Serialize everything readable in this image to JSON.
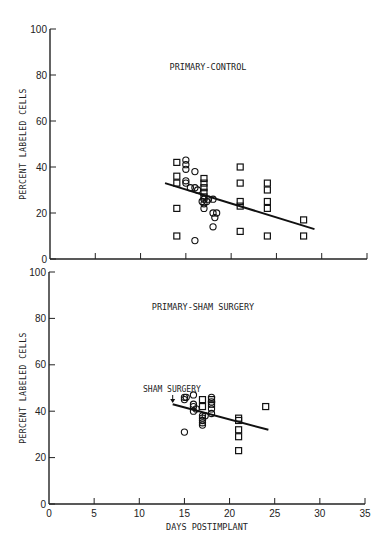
{
  "chart_data": [
    {
      "type": "scatter",
      "title": "PRIMARY-CONTROL",
      "xlabel": "",
      "ylabel": "Percent Labeled Cells",
      "xlim": [
        0,
        35
      ],
      "ylim": [
        0,
        100
      ],
      "x_ticks": [
        0,
        5,
        10,
        15,
        20,
        25,
        30,
        35
      ],
      "y_ticks": [
        0,
        20,
        40,
        60,
        80,
        100
      ],
      "x_tick_labels_shown": false,
      "grid": false,
      "series": [
        {
          "name": "squares",
          "marker": "square",
          "points": [
            [
              14,
              42
            ],
            [
              14,
              36
            ],
            [
              14,
              33
            ],
            [
              14,
              22
            ],
            [
              14,
              10
            ],
            [
              17,
              35
            ],
            [
              17,
              33
            ],
            [
              17,
              31
            ],
            [
              17,
              29
            ],
            [
              17,
              27
            ],
            [
              21,
              40
            ],
            [
              21,
              33
            ],
            [
              21,
              25
            ],
            [
              21,
              23
            ],
            [
              21,
              12
            ],
            [
              24,
              33
            ],
            [
              24,
              30
            ],
            [
              24,
              25
            ],
            [
              24,
              22
            ],
            [
              24,
              10
            ],
            [
              28,
              17
            ],
            [
              28,
              10
            ]
          ]
        },
        {
          "name": "circles",
          "marker": "circle",
          "points": [
            [
              15,
              43
            ],
            [
              15,
              41
            ],
            [
              15,
              39
            ],
            [
              15,
              34
            ],
            [
              15,
              33
            ],
            [
              15.5,
              31
            ],
            [
              16,
              38
            ],
            [
              16,
              31
            ],
            [
              16.3,
              30
            ],
            [
              16.8,
              25
            ],
            [
              17,
              26
            ],
            [
              17,
              24
            ],
            [
              17,
              22
            ],
            [
              17.3,
              25
            ],
            [
              17.5,
              26
            ],
            [
              18,
              26
            ],
            [
              18,
              20
            ],
            [
              18.2,
              18
            ],
            [
              18.4,
              20
            ],
            [
              18,
              14
            ],
            [
              16,
              8
            ]
          ]
        }
      ],
      "regression_line": {
        "x": [
          12.7,
          29.2
        ],
        "y": [
          33,
          13
        ]
      }
    },
    {
      "type": "scatter",
      "title": "PRIMARY-SHAM SURGERY",
      "xlabel": "Days Postimplant",
      "ylabel": "Percent Labeled Cells",
      "xlim": [
        0,
        35
      ],
      "ylim": [
        0,
        100
      ],
      "x_ticks": [
        0,
        5,
        10,
        15,
        20,
        25,
        30,
        35
      ],
      "y_ticks": [
        0,
        20,
        40,
        60,
        80,
        100
      ],
      "grid": false,
      "annotation": {
        "text": "Sham surgery",
        "arrow_x": 13.7,
        "arrow_y": 44
      },
      "series": [
        {
          "name": "squares",
          "marker": "square",
          "points": [
            [
              17,
              45
            ],
            [
              17,
              42
            ],
            [
              18,
              45
            ],
            [
              18,
              43
            ],
            [
              21,
              37
            ],
            [
              21,
              36
            ],
            [
              21,
              32
            ],
            [
              21,
              29
            ],
            [
              21,
              23
            ],
            [
              24,
              42
            ]
          ]
        },
        {
          "name": "circles",
          "marker": "circle",
          "points": [
            [
              15,
              46
            ],
            [
              15,
              45
            ],
            [
              15.2,
              46
            ],
            [
              15,
              31
            ],
            [
              16,
              47
            ],
            [
              16,
              43
            ],
            [
              16,
              42
            ],
            [
              16,
              40
            ],
            [
              16.3,
              41
            ],
            [
              17,
              38
            ],
            [
              17,
              37
            ],
            [
              17,
              36
            ],
            [
              17,
              35
            ],
            [
              17,
              34
            ],
            [
              17.3,
              38
            ],
            [
              18,
              46
            ],
            [
              18,
              44
            ],
            [
              18,
              41
            ],
            [
              18,
              39
            ]
          ]
        }
      ],
      "regression_line": {
        "x": [
          13.7,
          24.3
        ],
        "y": [
          43,
          32
        ]
      }
    }
  ],
  "labels": {
    "top_title": "PRIMARY-CONTROL",
    "bottom_title": "PRIMARY-SHAM SURGERY",
    "ylabel": "Percent Labeled Cells",
    "xlabel": "Days Postimplant",
    "annotation": "Sham surgery",
    "y_tick_labels": [
      "0",
      "20",
      "40",
      "60",
      "80",
      "100"
    ],
    "x_tick_labels": [
      "0",
      "5",
      "10",
      "15",
      "20",
      "25",
      "30",
      "35"
    ]
  }
}
